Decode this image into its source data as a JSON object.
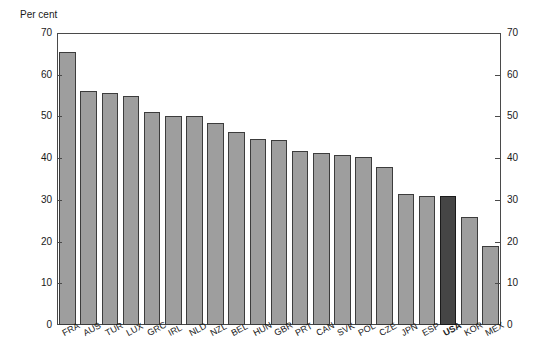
{
  "chart_data": {
    "type": "bar",
    "title": "",
    "subtitle": "",
    "xlabel": "",
    "ylabel": "Per cent",
    "unit_label": "Per cent",
    "ylim": [
      0,
      70
    ],
    "y_ticks": [
      0,
      10,
      20,
      30,
      40,
      50,
      60,
      70
    ],
    "y_tick_labels": [
      "0",
      "10",
      "20",
      "30",
      "40",
      "50",
      "60",
      "70"
    ],
    "right_axis": true,
    "right_ylim": [
      0,
      70
    ],
    "right_y_ticks": [
      0,
      10,
      20,
      30,
      40,
      50,
      60,
      70
    ],
    "right_y_tick_labels": [
      "0",
      "10",
      "20",
      "30",
      "40",
      "50",
      "60",
      "70"
    ],
    "grid": false,
    "legend": false,
    "categories": [
      "FRA",
      "AUS",
      "TUR",
      "LUX",
      "GRC",
      "IRL",
      "NLD",
      "NZL",
      "BEL",
      "HUN",
      "GBR",
      "PRT",
      "CAN",
      "SVK",
      "POL",
      "CZE",
      "JPN",
      "ESP",
      "USA",
      "KOR",
      "MEX"
    ],
    "values": [
      65.5,
      56.0,
      55.7,
      54.8,
      51.0,
      50.2,
      50.0,
      48.5,
      46.2,
      44.7,
      44.3,
      41.6,
      41.3,
      40.8,
      40.3,
      37.8,
      31.5,
      31.0,
      31.0,
      26.0,
      19.0
    ],
    "highlight_category": "USA",
    "colors": {
      "bar": "#9e9e9e",
      "bar_highlight": "#454545",
      "bar_border": "#3c3c3c",
      "axis": "#4a4a4a",
      "text": "#1a1a1a",
      "background": "#ffffff"
    }
  }
}
